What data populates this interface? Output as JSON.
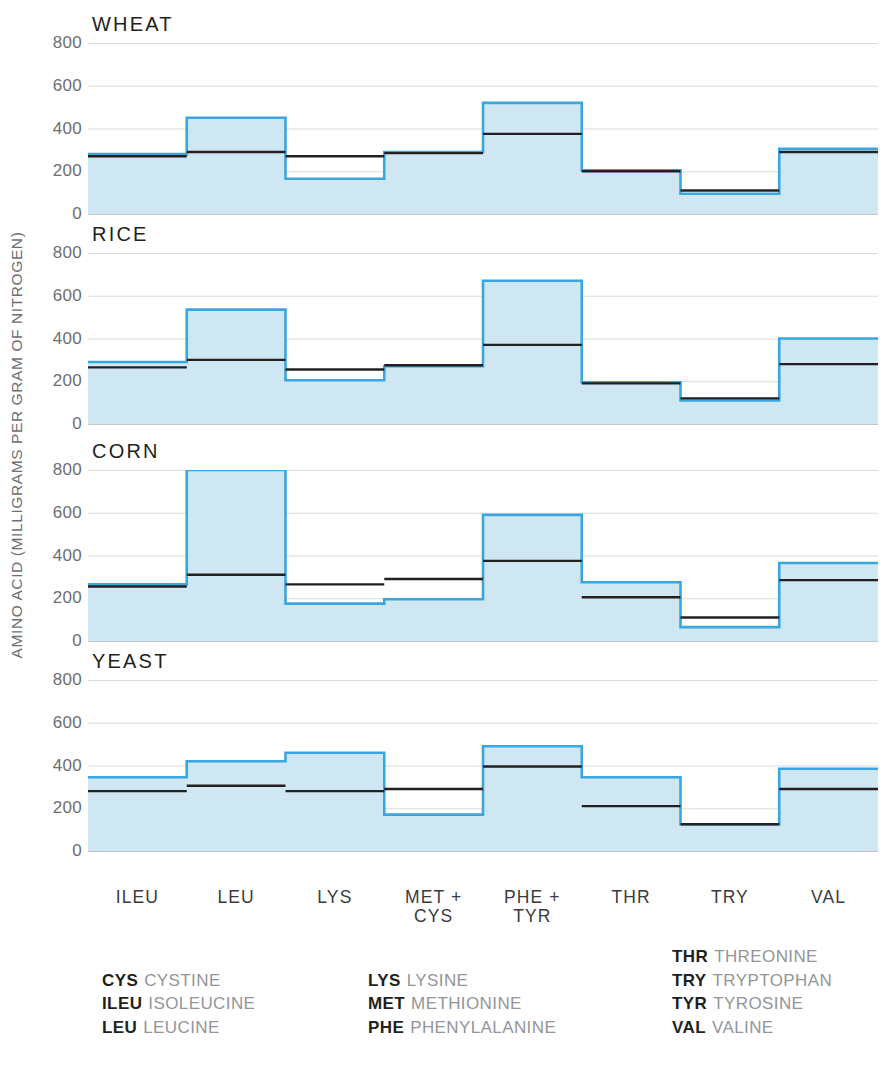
{
  "chart": {
    "type": "area",
    "ylabel": "AMINO ACID (MILLIGRAMS PER GRAM OF NITROGEN)",
    "ylim": [
      0,
      800
    ],
    "yticks": [
      0,
      200,
      400,
      600,
      800
    ],
    "ytick_labels": [
      "0",
      "200",
      "400",
      "600",
      "800"
    ],
    "grid": true,
    "legend_position": "bottom",
    "xlabel": "",
    "categories": [
      {
        "line1": "ILEU",
        "line2": ""
      },
      {
        "line1": "LEU",
        "line2": ""
      },
      {
        "line1": "LYS",
        "line2": ""
      },
      {
        "line1": "MET +",
        "line2": "CYS"
      },
      {
        "line1": "PHE +",
        "line2": "TYR"
      },
      {
        "line1": "THR",
        "line2": ""
      },
      {
        "line1": "TRY",
        "line2": ""
      },
      {
        "line1": "VAL",
        "line2": ""
      }
    ],
    "series_names": [
      "content",
      "requirement"
    ],
    "colors": {
      "fill": "#cfe7f2",
      "outline": "#3aa6e0",
      "reference_line": "#231f20",
      "gridline": "#b8babc",
      "tick_text": "#6d6e70",
      "title_text": "#231f20",
      "legend_full_text": "#939598"
    },
    "panels": [
      {
        "title": "WHEAT",
        "content": [
          280,
          450,
          165,
          290,
          520,
          205,
          95,
          305
        ],
        "requirement": [
          270,
          290,
          270,
          285,
          375,
          200,
          110,
          290
        ]
      },
      {
        "title": "RICE",
        "content": [
          290,
          535,
          205,
          270,
          670,
          195,
          110,
          400
        ],
        "requirement": [
          265,
          300,
          255,
          275,
          370,
          190,
          120,
          280
        ]
      },
      {
        "title": "CORN",
        "content": [
          265,
          800,
          175,
          195,
          590,
          275,
          65,
          365
        ],
        "requirement": [
          255,
          310,
          265,
          290,
          375,
          205,
          110,
          285
        ]
      },
      {
        "title": "YEAST",
        "content": [
          345,
          420,
          460,
          170,
          490,
          345,
          125,
          385
        ],
        "requirement": [
          280,
          305,
          280,
          290,
          395,
          210,
          125,
          290
        ]
      }
    ]
  },
  "legend": {
    "columns": [
      [
        {
          "abbr": "CYS",
          "full": "CYSTINE"
        },
        {
          "abbr": "ILEU",
          "full": "ISOLEUCINE"
        },
        {
          "abbr": "LEU",
          "full": "LEUCINE"
        }
      ],
      [
        {
          "abbr": "LYS",
          "full": "LYSINE"
        },
        {
          "abbr": "MET",
          "full": "METHIONINE"
        },
        {
          "abbr": "PHE",
          "full": "PHENYLALANINE"
        }
      ],
      [
        {
          "abbr": "THR",
          "full": "THREONINE"
        },
        {
          "abbr": "TRY",
          "full": "TRYPTOPHAN"
        },
        {
          "abbr": "TYR",
          "full": "TYROSINE"
        },
        {
          "abbr": "VAL",
          "full": "VALINE"
        }
      ]
    ]
  }
}
